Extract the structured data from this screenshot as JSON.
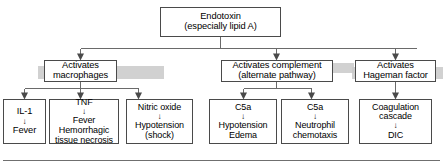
{
  "diagram": {
    "title_node": {
      "id": "endotoxin",
      "lines": [
        "Endotoxin",
        "(especially lipid A)"
      ]
    },
    "mid_nodes": [
      {
        "id": "activates-macrophages",
        "lines": [
          "Activates",
          "macrophages"
        ]
      },
      {
        "id": "activates-complement",
        "lines": [
          "Activates complement",
          "(alternate pathway)"
        ]
      },
      {
        "id": "activates-hageman-factor",
        "lines": [
          "Activates",
          "Hageman factor"
        ]
      }
    ],
    "leaf_nodes": [
      {
        "id": "il-1-fever",
        "lines": [
          "IL-1",
          "↓",
          "Fever"
        ]
      },
      {
        "id": "tnf-effects",
        "lines": [
          "TNF",
          "↓",
          "Fever",
          "Hemorrhagic",
          "tissue necrosis"
        ]
      },
      {
        "id": "nitric-oxide-hypotension",
        "lines": [
          "Nitric oxide",
          "↓",
          "Hypotension",
          "(shock)"
        ]
      },
      {
        "id": "c5a-hypotension-edema",
        "lines": [
          "C5a",
          "↓",
          "Hypotension",
          "Edema"
        ]
      },
      {
        "id": "c5a-neutrophil-chemotaxis",
        "lines": [
          "C5a",
          "↓",
          "Neutrophil",
          "chemotaxis"
        ]
      },
      {
        "id": "coagulation-cascade-dic",
        "lines": [
          "Coagulation",
          "cascade",
          "↓",
          "DIC"
        ]
      }
    ],
    "arrow_glyph": "↓",
    "colors": {
      "box_border": "#4a4a4a",
      "shadow": "#c9c9c9",
      "connector": "#5a5a5a",
      "text": "#000000",
      "background": "#ffffff"
    }
  }
}
